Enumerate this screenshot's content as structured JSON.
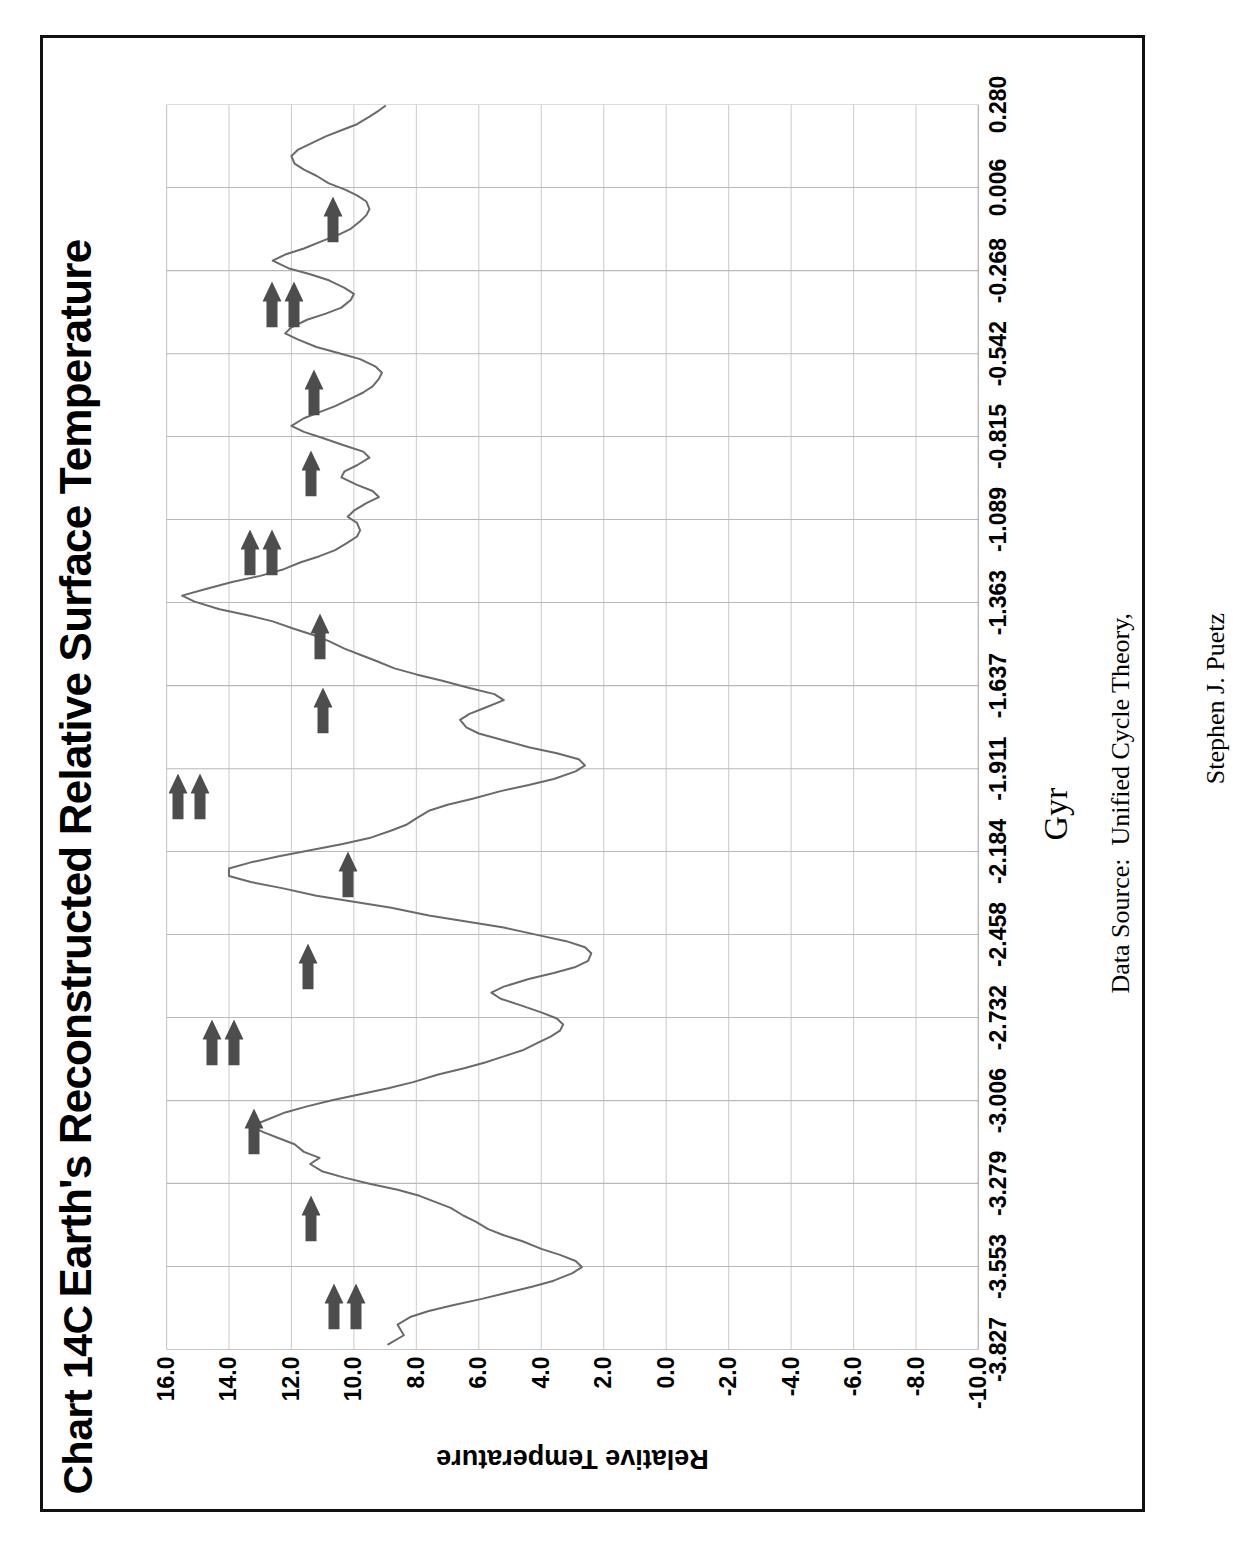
{
  "figure": {
    "chart_number": "Chart 14C",
    "title": "Earth's Reconstructed Relative Surface Temperature",
    "source_line1": "Data Source:  Unified Cycle Theory,",
    "source_line2": "Stephen J. Puetz",
    "rotation_note": "figure rotated 90 degrees counter-clockwise on the page"
  },
  "chart_data": {
    "type": "line",
    "title": "Earth's Reconstructed Relative Surface Temperature",
    "subtitle": "Chart 14C",
    "xlabel": "Gyr",
    "ylabel": "Relative Temperature",
    "xlim": [
      -3.827,
      0.28
    ],
    "ylim": [
      -10.0,
      16.0
    ],
    "grid": true,
    "legend": null,
    "xticks": [
      -3.827,
      -3.553,
      -3.279,
      -3.006,
      -2.732,
      -2.458,
      -2.184,
      -1.911,
      -1.637,
      -1.363,
      -1.089,
      -0.815,
      -0.542,
      -0.268,
      0.006,
      0.28
    ],
    "xtick_labels": [
      "-3.827",
      "-3.553",
      "-3.279",
      "-3.006",
      "-2.732",
      "-2.458",
      "-2.184",
      "-1.911",
      "-1.637",
      "-1.363",
      "-1.089",
      "-0.815",
      "-0.542",
      "-0.268",
      "0.006",
      "0.280"
    ],
    "yticks": [
      16.0,
      14.0,
      12.0,
      10.0,
      8.0,
      6.0,
      4.0,
      2.0,
      0.0,
      -2.0,
      -4.0,
      -6.0,
      -8.0,
      -10.0
    ],
    "ytick_labels": [
      "16.0",
      "14.0",
      "12.0",
      "10.0",
      "8.0",
      "6.0",
      "4.0",
      "2.0",
      "0.0",
      "-2.0",
      "-4.0",
      "-6.0",
      "-8.0",
      "-10.0"
    ],
    "series": [
      {
        "name": "Relative Temperature",
        "color": "#6a6a6a",
        "x": [
          -3.81,
          -3.78,
          -3.745,
          -3.72,
          -3.7,
          -3.68,
          -3.66,
          -3.64,
          -3.62,
          -3.6,
          -3.575,
          -3.555,
          -3.535,
          -3.515,
          -3.495,
          -3.47,
          -3.45,
          -3.43,
          -3.405,
          -3.385,
          -3.36,
          -3.34,
          -3.32,
          -3.3,
          -3.28,
          -3.26,
          -3.24,
          -3.215,
          -3.195,
          -3.175,
          -3.15,
          -3.13,
          -3.11,
          -3.09,
          -3.07,
          -3.045,
          -3.025,
          -3.005,
          -2.985,
          -2.965,
          -2.945,
          -2.92,
          -2.9,
          -2.88,
          -2.86,
          -2.84,
          -2.815,
          -2.795,
          -2.775,
          -2.755,
          -2.735,
          -2.715,
          -2.69,
          -2.67,
          -2.65,
          -2.63,
          -2.605,
          -2.585,
          -2.565,
          -2.545,
          -2.52,
          -2.5,
          -2.48,
          -2.46,
          -2.435,
          -2.415,
          -2.395,
          -2.37,
          -2.35,
          -2.33,
          -2.305,
          -2.285,
          -2.265,
          -2.24,
          -2.22,
          -2.2,
          -2.18,
          -2.16,
          -2.14,
          -2.115,
          -2.095,
          -2.075,
          -2.05,
          -2.03,
          -2.01,
          -1.985,
          -1.965,
          -1.945,
          -1.92,
          -1.9,
          -1.88,
          -1.86,
          -1.84,
          -1.815,
          -1.795,
          -1.775,
          -1.75,
          -1.73,
          -1.71,
          -1.685,
          -1.665,
          -1.645,
          -1.62,
          -1.6,
          -1.58,
          -1.555,
          -1.535,
          -1.515,
          -1.49,
          -1.47,
          -1.45,
          -1.425,
          -1.405,
          -1.385,
          -1.36,
          -1.34,
          -1.32,
          -1.295,
          -1.275,
          -1.255,
          -1.23,
          -1.21,
          -1.19,
          -1.165,
          -1.145,
          -1.125,
          -1.1,
          -1.08,
          -1.06,
          -1.035,
          -1.015,
          -0.995,
          -0.975,
          -0.95,
          -0.93,
          -0.91,
          -0.885,
          -0.865,
          -0.845,
          -0.82,
          -0.8,
          -0.78,
          -0.755,
          -0.735,
          -0.715,
          -0.69,
          -0.67,
          -0.65,
          -0.625,
          -0.605,
          -0.585,
          -0.56,
          -0.54,
          -0.52,
          -0.495,
          -0.475,
          -0.455,
          -0.43,
          -0.41,
          -0.39,
          -0.365,
          -0.345,
          -0.325,
          -0.3,
          -0.28,
          -0.26,
          -0.235,
          -0.215,
          -0.195,
          -0.17,
          -0.15,
          -0.13,
          -0.105,
          -0.085,
          -0.065,
          -0.04,
          -0.02,
          0.0,
          0.02,
          0.045,
          0.065,
          0.085,
          0.11,
          0.13,
          0.15,
          0.175,
          0.195,
          0.215,
          0.24,
          0.26,
          0.275
        ],
        "y": [
          8.9,
          8.4,
          8.6,
          8.2,
          7.6,
          6.8,
          5.9,
          5.1,
          4.3,
          3.6,
          3.0,
          2.7,
          2.9,
          3.4,
          4.0,
          4.6,
          5.2,
          5.7,
          6.1,
          6.5,
          6.9,
          7.4,
          7.9,
          8.6,
          9.5,
          10.3,
          11.0,
          11.4,
          11.1,
          11.6,
          11.9,
          12.4,
          12.9,
          13.3,
          12.8,
          12.2,
          11.5,
          10.7,
          9.8,
          8.9,
          8.1,
          7.3,
          6.5,
          5.8,
          5.2,
          4.6,
          4.1,
          3.7,
          3.4,
          3.3,
          3.5,
          4.0,
          4.7,
          5.3,
          5.6,
          5.2,
          4.4,
          3.6,
          2.9,
          2.5,
          2.4,
          2.6,
          3.2,
          4.1,
          5.2,
          6.4,
          7.6,
          8.8,
          10.0,
          11.2,
          12.3,
          13.3,
          14.0,
          14.0,
          13.3,
          12.4,
          11.4,
          10.4,
          9.5,
          8.8,
          8.3,
          8.0,
          7.6,
          7.0,
          6.2,
          5.3,
          4.4,
          3.6,
          2.9,
          2.6,
          2.8,
          3.5,
          4.4,
          5.3,
          6.0,
          6.4,
          6.6,
          6.3,
          5.8,
          5.2,
          5.5,
          6.3,
          7.2,
          8.0,
          8.7,
          9.3,
          9.8,
          10.3,
          10.8,
          11.3,
          11.9,
          12.6,
          13.4,
          14.3,
          15.1,
          15.5,
          14.8,
          13.9,
          13.0,
          12.3,
          11.7,
          11.1,
          10.6,
          10.2,
          9.9,
          9.8,
          9.9,
          10.2,
          10.0,
          9.6,
          9.2,
          9.4,
          9.9,
          10.4,
          10.3,
          9.9,
          9.5,
          9.7,
          10.3,
          11.0,
          11.6,
          12.0,
          11.6,
          11.1,
          10.6,
          10.1,
          9.7,
          9.4,
          9.2,
          9.1,
          9.3,
          9.8,
          10.5,
          11.2,
          11.8,
          12.2,
          12.0,
          11.5,
          10.9,
          10.4,
          10.1,
          10.0,
          10.3,
          10.8,
          11.4,
          12.1,
          12.6,
          12.2,
          11.6,
          11.0,
          10.5,
          10.1,
          9.8,
          9.6,
          9.5,
          9.6,
          9.9,
          10.3,
          10.8,
          11.2,
          11.6,
          11.9,
          12.0,
          11.8,
          11.4,
          10.9,
          10.4,
          9.9,
          9.5,
          9.2,
          9.0
        ]
      }
    ],
    "annotations": {
      "marker_symbol": "right-pointing-block-arrow",
      "marker_color": "#4d4d4d",
      "markers": [
        {
          "gyr": -3.575,
          "temp": 10.3,
          "count": 2
        },
        {
          "gyr": -3.285,
          "temp": 11.4,
          "count": 1
        },
        {
          "gyr": -3.0,
          "temp": 13.2,
          "count": 1
        },
        {
          "gyr": -2.705,
          "temp": 14.2,
          "count": 2
        },
        {
          "gyr": -2.455,
          "temp": 11.5,
          "count": 1
        },
        {
          "gyr": -2.15,
          "temp": 10.2,
          "count": 1
        },
        {
          "gyr": -1.895,
          "temp": 15.3,
          "count": 2
        },
        {
          "gyr": -1.61,
          "temp": 11.0,
          "count": 1
        },
        {
          "gyr": -1.365,
          "temp": 11.1,
          "count": 1
        },
        {
          "gyr": -1.09,
          "temp": 13.0,
          "count": 2
        },
        {
          "gyr": -0.83,
          "temp": 11.4,
          "count": 1
        },
        {
          "gyr": -0.56,
          "temp": 11.3,
          "count": 1
        },
        {
          "gyr": -0.27,
          "temp": 12.3,
          "count": 2
        },
        {
          "gyr": 0.01,
          "temp": 10.7,
          "count": 1
        }
      ]
    }
  }
}
